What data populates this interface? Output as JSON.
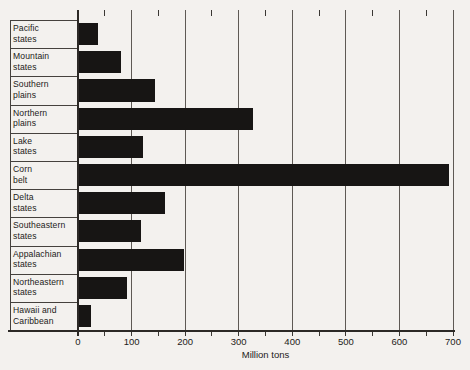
{
  "figure": {
    "background_color": "#f3f1ee",
    "bar_color": "#171514",
    "gridline_color": "#5e5954",
    "axis_color": "#2c2926",
    "text_color": "#1d1b19"
  },
  "chart_data": {
    "type": "bar",
    "orientation": "horizontal",
    "title": "",
    "xlabel": "Million tons",
    "ylabel": "",
    "xlim": [
      0,
      700
    ],
    "x_major_ticks": [
      0,
      100,
      200,
      300,
      400,
      500,
      600,
      700
    ],
    "x_minor_tick_step": 50,
    "grid": "vertical gridlines at major ticks",
    "legend_position": "none",
    "categories": [
      "Pacific states",
      "Mountain states",
      "Southern plains",
      "Northern plains",
      "Lake states",
      "Corn belt",
      "Delta states",
      "Southeastern states",
      "Appalachian states",
      "Northeastern states",
      "Hawaii and Caribbean"
    ],
    "values": [
      35,
      78,
      142,
      325,
      120,
      690,
      160,
      116,
      195,
      90,
      22
    ]
  }
}
